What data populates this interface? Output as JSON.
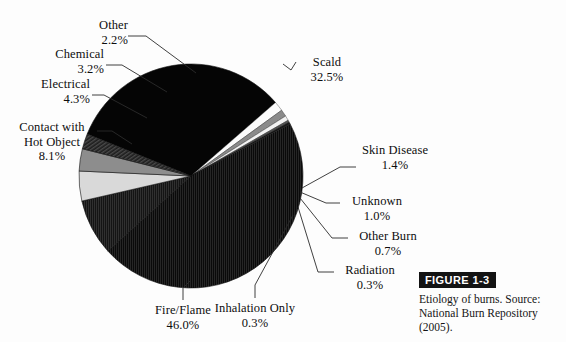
{
  "figure": {
    "tag": "FIGURE 1-3",
    "caption": "Etiology of burns. Source: National Burn Repository (2005)."
  },
  "labels": {
    "other": {
      "name": "Other",
      "pct": "2.2%"
    },
    "chemical": {
      "name": "Chemical",
      "pct": "3.2%"
    },
    "electrical": {
      "name": "Electrical",
      "pct": "4.3%"
    },
    "contact": {
      "name": "Contact with",
      "name2": "Hot Object",
      "pct": "8.1%"
    },
    "fire": {
      "name": "Fire/Flame",
      "pct": "46.0%"
    },
    "inhalation": {
      "name": "Inhalation Only",
      "pct": "0.3%"
    },
    "radiation": {
      "name": "Radiation",
      "pct": "0.3%"
    },
    "otherburn": {
      "name": "Other Burn",
      "pct": "0.7%"
    },
    "unknown": {
      "name": "Unknown",
      "pct": "1.0%"
    },
    "skin": {
      "name": "Skin Disease",
      "pct": "1.4%"
    },
    "scald": {
      "name": "Scald",
      "pct": "32.5%"
    }
  },
  "chart_data": {
    "type": "pie",
    "title": "Etiology of burns",
    "subtitle": "Source: National Burn Repository (2005).",
    "xlabel": "",
    "ylabel": "",
    "grid": false,
    "legend": "none (direct labels with leader lines)",
    "total_pct": 100.0,
    "start_angle_deg": -68,
    "direction": "clockwise",
    "center_px": [
      191,
      176
    ],
    "radius_px": 112,
    "categories": [
      "Scald",
      "Skin Disease",
      "Unknown",
      "Other Burn",
      "Radiation",
      "Inhalation Only",
      "Fire/Flame",
      "Contact with Hot Object",
      "Electrical",
      "Chemical",
      "Other"
    ],
    "values": [
      32.5,
      1.4,
      1.0,
      0.7,
      0.3,
      0.3,
      46.0,
      8.1,
      4.3,
      3.2,
      2.2
    ],
    "slices": [
      {
        "label": "Scald",
        "value": 32.5,
        "color": "#050505",
        "fill_style": "solid"
      },
      {
        "label": "Skin Disease",
        "value": 1.4,
        "color": "#fbfbfb",
        "fill_style": "solid"
      },
      {
        "label": "Unknown",
        "value": 1.0,
        "color": "#8a8a8a",
        "fill_style": "solid"
      },
      {
        "label": "Other Burn",
        "value": 0.7,
        "color": "#f2f2f2",
        "fill_style": "solid"
      },
      {
        "label": "Radiation",
        "value": 0.3,
        "color": "#555555",
        "fill_style": "solid"
      },
      {
        "label": "Inhalation Only",
        "value": 0.3,
        "color": "#1a1a1a",
        "fill_style": "solid"
      },
      {
        "label": "Fire/Flame",
        "value": 46.0,
        "color": "#0a0a0a",
        "fill_style": "vertical-hatch"
      },
      {
        "label": "Contact with Hot Object",
        "value": 8.1,
        "color": "#141414",
        "fill_style": "vertical-hatch"
      },
      {
        "label": "Electrical",
        "value": 4.3,
        "color": "#d9d9d9",
        "fill_style": "solid"
      },
      {
        "label": "Chemical",
        "value": 3.2,
        "color": "#8d8d8d",
        "fill_style": "solid"
      },
      {
        "label": "Other",
        "value": 2.2,
        "color": "#2a2a2a",
        "fill_style": "diagonal-hatch"
      }
    ],
    "colors": {
      "background": "#fdfdfd",
      "text": "#0d0d0d",
      "leader_line": "#2b2b2b",
      "tag_background": "#131313",
      "tag_text": "#ffffff"
    }
  }
}
